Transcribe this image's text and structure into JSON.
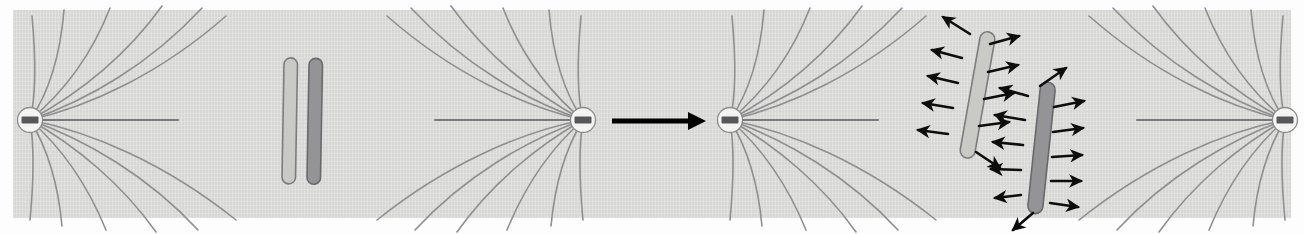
{
  "figure": {
    "caption": "",
    "background_color": "#fdfdfd",
    "panel_color": "#dededc",
    "panel": {
      "x": 13,
      "y": 10,
      "width": 1278,
      "height": 208
    }
  },
  "legend_colors": {
    "microtubule": "#8f8f92",
    "centrosome_fill": "#f4f4f2",
    "centriole_bar": "#58585a",
    "chromatid_light": "#c9c9c6",
    "chromatid_dark": "#949496",
    "force_arrow": "#0d0d0d",
    "transition_arrow": "#000000"
  },
  "stages": [
    {
      "id": "stage-1",
      "name": "aster-left",
      "label": "",
      "centrosome": {
        "cx": 30,
        "cy": 120,
        "r": 13
      },
      "opens": "right"
    },
    {
      "id": "stage-2",
      "name": "aster-second",
      "label": "",
      "centrosome": {
        "cx": 583,
        "cy": 120,
        "r": 13
      },
      "opens": "left"
    },
    {
      "id": "stage-3",
      "name": "aster-third",
      "label": "",
      "centrosome": {
        "cx": 730,
        "cy": 120,
        "r": 13
      },
      "opens": "right"
    },
    {
      "id": "stage-4",
      "name": "aster-right",
      "label": "",
      "centrosome": {
        "cx": 1285,
        "cy": 120,
        "r": 13
      },
      "opens": "left"
    }
  ],
  "chromosomes": {
    "pair_before": {
      "name": "chromosome-pair-unattached",
      "label": "",
      "chromatids": [
        {
          "name": "chromatid-light",
          "fill": "#c9c9c6",
          "x": 289,
          "y_top": 58,
          "y_bottom": 184,
          "width": 13,
          "tilt_deg": 1
        },
        {
          "name": "chromatid-dark",
          "fill": "#949496",
          "x": 314,
          "y_top": 58,
          "y_bottom": 184,
          "width": 13,
          "tilt_deg": 1
        }
      ]
    },
    "pair_after": {
      "name": "chromosome-pair-with-forces",
      "label": "",
      "chromatids": [
        {
          "name": "chromatid-light-forced",
          "fill": "#c9c9c6",
          "cx": 978,
          "cy": 95,
          "length": 128,
          "width": 15,
          "tilt_deg": 10,
          "arrow_count": 9
        },
        {
          "name": "chromatid-dark-forced",
          "fill": "#949496",
          "cx": 1042,
          "cy": 148,
          "length": 132,
          "width": 15,
          "tilt_deg": 6,
          "arrow_count": 10
        }
      ]
    }
  },
  "transition_arrow": {
    "name": "transition-arrow",
    "label": "",
    "x_start": 612,
    "x_end": 700,
    "y": 121,
    "direction": "right"
  },
  "microtubule_counts": {
    "curved_per_aster": 12,
    "long_axial_per_aster": 1
  }
}
